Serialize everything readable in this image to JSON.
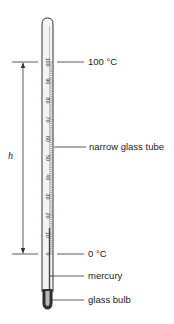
{
  "diagram": {
    "labels": {
      "top_fixed_point": "100 °C",
      "tube": "narrow glass tube",
      "bottom_fixed_point": "0 °C",
      "liquid": "mercury",
      "bulb": "glass bulb"
    },
    "dimension_label": "h",
    "scale": {
      "ticks": [
        "100",
        "90",
        "80",
        "70",
        "60",
        "50",
        "40",
        "30",
        "20",
        "10",
        "0"
      ],
      "min": 0,
      "max": 100,
      "major_step": 10
    },
    "colors": {
      "line": "#333333",
      "glass": "#f2f2f2",
      "mercury": "#555555"
    }
  }
}
